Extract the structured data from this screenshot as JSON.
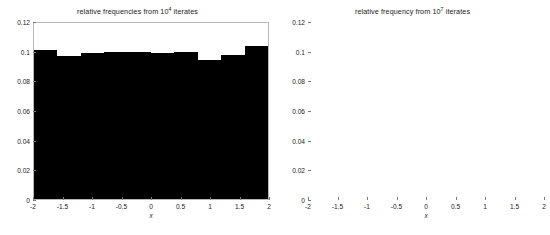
{
  "figure": {
    "background": "#ffffff",
    "bar_color": "#000000",
    "axis_color": "#b8b8b8",
    "text_color": "#1a1a1a"
  },
  "chart_data": [
    {
      "type": "bar",
      "panel": "left",
      "title_prefix": "relative frequencies from 10",
      "title_exponent": "4",
      "title_suffix": " iterates",
      "title": "relative frequencies from 10^4 iterates",
      "xlabel": "x",
      "ylabel": "",
      "xlim": [
        -2,
        2
      ],
      "ylim": [
        0,
        0.12
      ],
      "grid": false,
      "legend": "none",
      "xticks": [
        "-2",
        "-1.5",
        "-1",
        "-0.5",
        "0",
        "0.5",
        "1",
        "1.5",
        "2"
      ],
      "xtick_values": [
        -2,
        -1.5,
        -1,
        -0.5,
        0,
        0.5,
        1,
        1.5,
        2
      ],
      "yticks": [
        "0",
        "0.02",
        "0.04",
        "0.06",
        "0.08",
        "0.1",
        "0.12"
      ],
      "ytick_values": [
        0,
        0.02,
        0.04,
        0.06,
        0.08,
        0.1,
        0.12
      ],
      "bin_edges": [
        -2,
        -1.8,
        -1.6,
        -1.4,
        -1.2,
        -1.0,
        -0.8,
        -0.6,
        -0.4,
        -0.2,
        0,
        0.2,
        0.4,
        0.6,
        0.8,
        1.0,
        1.2,
        1.4,
        1.6,
        1.8,
        2.0
      ],
      "values": [
        0.1015,
        0.1015,
        0.0975,
        0.0975,
        0.0995,
        0.0995,
        0.1005,
        0.1005,
        0.1,
        0.1,
        0.0995,
        0.0995,
        0.1005,
        0.1,
        0.0945,
        0.0945,
        0.0985,
        0.0985,
        0.1045,
        0.1045
      ]
    },
    {
      "type": "bar",
      "panel": "right",
      "title_prefix": "relative frequency from 10",
      "title_exponent": "7",
      "title_suffix": " iterates",
      "title": "relative frequency from 10^7 iterates",
      "xlabel": "x",
      "ylabel": "",
      "xlim": [
        -2,
        2
      ],
      "ylim": [
        0,
        0.12
      ],
      "grid": false,
      "legend": "none",
      "xticks": [
        "-2",
        "-1.5",
        "-1",
        "-0.5",
        "0",
        "0.5",
        "1",
        "1.5",
        "2"
      ],
      "xtick_values": [
        -2,
        -1.5,
        -1,
        -0.5,
        0,
        0.5,
        1,
        1.5,
        2
      ],
      "yticks": [
        "0",
        "0.02",
        "0.04",
        "0.06",
        "0.08",
        "0.1",
        "0.12"
      ],
      "ytick_values": [
        0,
        0.02,
        0.04,
        0.06,
        0.08,
        0.1,
        0.12
      ],
      "bin_edges": [
        -2,
        -1.8,
        -1.6,
        -1.4,
        -1.2,
        -1.0,
        -0.8,
        -0.6,
        -0.4,
        -0.2,
        0,
        0.2,
        0.4,
        0.6,
        0.8,
        1.0,
        1.2,
        1.4,
        1.6,
        1.8,
        2.0
      ],
      "values": [
        0.1,
        0.1,
        0.1,
        0.1,
        0.1,
        0.1,
        0.1,
        0.1,
        0.1,
        0.1,
        0.1,
        0.1,
        0.1,
        0.1,
        0.1,
        0.1,
        0.1,
        0.1,
        0.1,
        0.1
      ]
    }
  ]
}
